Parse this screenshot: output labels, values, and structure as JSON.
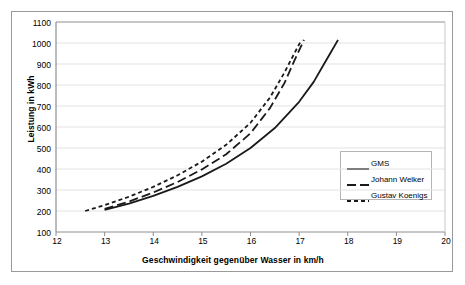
{
  "axes": {
    "ylabel": "Leistung in kWh",
    "xlabel": "Geschwindigkeit gegenüber Wasser in km/h",
    "yticks": [
      "1100",
      "1000",
      "900",
      "800",
      "700",
      "600",
      "500",
      "400",
      "300",
      "200",
      "100"
    ],
    "xticks": [
      "12",
      "13",
      "14",
      "15",
      "16",
      "17",
      "18",
      "19",
      "20"
    ]
  },
  "legend": {
    "items": [
      {
        "label": "GMS",
        "dash": "solid",
        "color": "#1a1a1a"
      },
      {
        "label": "Johann Welker",
        "dash": "long-dash",
        "color": "#1a1a1a"
      },
      {
        "label": "Gustav Koenigs",
        "dash": "short-dash",
        "color": "#1a1a1a"
      }
    ]
  },
  "chart_data": {
    "type": "line",
    "title": "",
    "xlabel": "Geschwindigkeit gegenüber Wasser in km/h",
    "ylabel": "Leistung in kWh",
    "xlim": [
      12,
      20
    ],
    "ylim": [
      100,
      1100
    ],
    "xticks": [
      12,
      13,
      14,
      15,
      16,
      17,
      18,
      19,
      20
    ],
    "yticks": [
      100,
      200,
      300,
      400,
      500,
      600,
      700,
      800,
      900,
      1000,
      1100
    ],
    "grid": "horizontal",
    "legend_position": "right-middle",
    "series": [
      {
        "name": "GMS",
        "dash": "solid",
        "color": "#1a1a1a",
        "x": [
          13.0,
          13.5,
          14.0,
          14.5,
          15.0,
          15.5,
          16.0,
          16.5,
          17.0,
          17.3,
          17.5,
          17.65,
          17.8
        ],
        "y": [
          205,
          235,
          272,
          315,
          365,
          425,
          500,
          595,
          720,
          815,
          895,
          955,
          1015
        ]
      },
      {
        "name": "Johann Welker",
        "dash": "long-dash",
        "color": "#1a1a1a",
        "x": [
          13.0,
          13.5,
          14.0,
          14.5,
          15.0,
          15.5,
          16.0,
          16.4,
          16.7,
          16.9,
          17.0,
          17.1
        ],
        "y": [
          210,
          245,
          288,
          338,
          398,
          470,
          570,
          690,
          810,
          915,
          965,
          1015
        ]
      },
      {
        "name": "Gustav Koenigs",
        "dash": "short-dash",
        "color": "#1a1a1a",
        "x": [
          12.6,
          13.0,
          13.5,
          14.0,
          14.5,
          15.0,
          15.5,
          16.0,
          16.4,
          16.7,
          16.9,
          17.05
        ],
        "y": [
          200,
          228,
          268,
          315,
          370,
          435,
          515,
          620,
          740,
          860,
          950,
          1015
        ]
      }
    ]
  }
}
